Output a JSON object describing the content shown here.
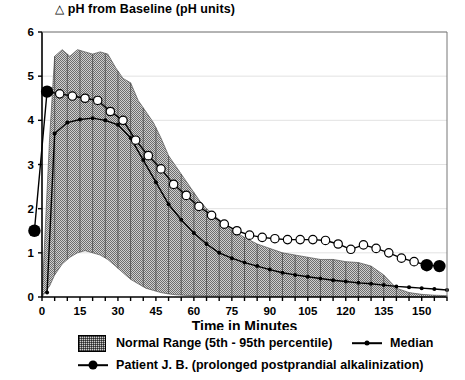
{
  "chart_data": {
    "type": "line",
    "title": "△ pH from Baseline (pH units)",
    "title_glyph": "△",
    "title_text": "pH from Baseline (pH units)",
    "xlabel": "Time in Minutes",
    "ylabel": "",
    "xlim": [
      0,
      160
    ],
    "ylim": [
      0,
      6
    ],
    "xticks": [
      0,
      15,
      30,
      45,
      60,
      75,
      90,
      105,
      120,
      135,
      150
    ],
    "yticks": [
      0,
      1,
      2,
      3,
      4,
      5,
      6
    ],
    "xtick_labels": [
      "0",
      "15",
      "30",
      "45",
      "60",
      "75",
      "90",
      "105",
      "120",
      "135",
      "150"
    ],
    "ytick_labels": [
      "0",
      "1",
      "2",
      "3",
      "4",
      "5",
      "6"
    ],
    "grid": "horizontal-light",
    "legend_position": "below-plot",
    "band": {
      "name": "Normal Range (5th - 95th percentile)",
      "fill": "#cfcfcf",
      "x": [
        0,
        3,
        5,
        8,
        11,
        14,
        17,
        20,
        23,
        26,
        29,
        32,
        35,
        38,
        41,
        44,
        47,
        50,
        53,
        56,
        59,
        62,
        65,
        68,
        71,
        74,
        77,
        80,
        85,
        90,
        95,
        100,
        105,
        110,
        115,
        120,
        125,
        130,
        135,
        140,
        145,
        150,
        155,
        160
      ],
      "upper": [
        0.0,
        3.6,
        5.45,
        5.6,
        5.45,
        5.6,
        5.55,
        5.5,
        5.55,
        5.5,
        5.2,
        4.95,
        4.85,
        4.45,
        4.2,
        3.95,
        3.6,
        3.2,
        2.95,
        2.7,
        2.45,
        2.2,
        2.0,
        1.85,
        1.7,
        1.55,
        1.45,
        1.35,
        1.2,
        1.1,
        1.0,
        0.95,
        0.9,
        0.85,
        0.85,
        0.8,
        0.78,
        0.7,
        0.5,
        0.2,
        0.1,
        0.06,
        0.04,
        0.03
      ],
      "lower": [
        0.0,
        0.25,
        0.5,
        0.75,
        0.9,
        1.0,
        1.05,
        1.0,
        0.95,
        0.85,
        0.7,
        0.55,
        0.4,
        0.3,
        0.2,
        0.15,
        0.1,
        0.07,
        0.05,
        0.04,
        0.03,
        0.03,
        0.02,
        0.02,
        0.02,
        0.02,
        0.02,
        0.02,
        0.01,
        0.01,
        0.01,
        0.01,
        0.01,
        0.01,
        0.01,
        0.01,
        0.01,
        0.01,
        0.01,
        0.0,
        0.0,
        0.0,
        0.0,
        0.0
      ]
    },
    "series": [
      {
        "name": "Median",
        "marker": "small-filled-circle",
        "color": "#000000",
        "x": [
          2,
          5,
          10,
          15,
          20,
          25,
          30,
          35,
          40,
          45,
          50,
          55,
          60,
          65,
          70,
          75,
          80,
          85,
          90,
          95,
          100,
          105,
          110,
          115,
          120,
          125,
          130,
          135,
          140,
          145,
          150,
          155,
          160
        ],
        "y": [
          0.1,
          3.7,
          3.95,
          4.02,
          4.05,
          4.0,
          3.9,
          3.6,
          3.1,
          2.6,
          2.1,
          1.75,
          1.45,
          1.2,
          1.0,
          0.88,
          0.78,
          0.7,
          0.62,
          0.55,
          0.5,
          0.46,
          0.42,
          0.38,
          0.35,
          0.32,
          0.3,
          0.27,
          0.24,
          0.22,
          0.2,
          0.18,
          0.16
        ]
      },
      {
        "name": "Patient J. B. (prolonged postprandial alkalinization)",
        "marker": "open-circle",
        "highlight_marker": "large-filled-circle",
        "color": "#000000",
        "x": [
          -3,
          2,
          7,
          12,
          17,
          22,
          27,
          32,
          37,
          42,
          47,
          52,
          57,
          62,
          67,
          72,
          77,
          82,
          87,
          92,
          97,
          102,
          107,
          112,
          117,
          122,
          127,
          132,
          137,
          142,
          147,
          152,
          157
        ],
        "y": [
          1.5,
          4.65,
          4.6,
          4.55,
          4.5,
          4.45,
          4.2,
          4.0,
          3.55,
          3.2,
          2.9,
          2.55,
          2.3,
          2.05,
          1.85,
          1.65,
          1.5,
          1.4,
          1.35,
          1.32,
          1.3,
          1.3,
          1.3,
          1.28,
          1.2,
          1.08,
          1.18,
          1.1,
          1.0,
          0.88,
          0.8,
          0.72,
          0.7
        ],
        "highlight_indices": [
          0,
          1,
          31,
          32
        ]
      }
    ]
  },
  "legend": {
    "normal_range": {
      "label": "Normal Range (5th - 95th percentile)",
      "swatch": "hatched-gray-box"
    },
    "median": {
      "label": "Median",
      "swatch": "line-with-small-dot"
    },
    "patient": {
      "label": "Patient J. B. (prolonged postprandial alkalinization)",
      "swatch": "line-with-large-dot"
    }
  }
}
